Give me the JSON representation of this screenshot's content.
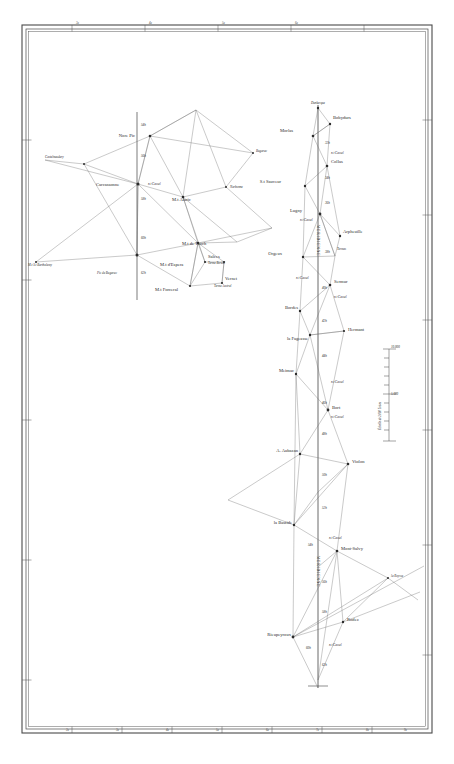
{
  "sheet": {
    "title": "Carte de la Meridienne de France — Triangulation",
    "background_color": "#ffffff",
    "ink_color": "#2b2b2b",
    "line_color": "#555555"
  },
  "frame": {
    "outer": {
      "x": 22,
      "y": 25,
      "w": 410,
      "h": 708
    },
    "inner_offset": 4,
    "top_ticks": [
      "3e",
      "4e",
      "5e",
      "6e"
    ],
    "bottom_ticks": [
      "2e",
      "3e",
      "4e",
      "5e",
      "6e",
      "7e",
      "8e",
      "9e"
    ],
    "left_ticks": [
      "44",
      "43",
      "42"
    ],
    "right_ticks": [
      "44",
      "43",
      "42",
      "41"
    ]
  },
  "scale_bar": {
    "caption": "Échelle de 2 000 Toises",
    "top_label": "10.000",
    "mid_label": "5.000",
    "ticks": [
      "10.000",
      "9",
      "8",
      "7",
      "6",
      "5.000",
      "4",
      "3",
      "2",
      "1",
      "0"
    ],
    "x": 389,
    "y_top": 349,
    "y_bottom": 441
  },
  "west_network": {
    "name": "Carcassonne – Mont Alaric group",
    "stations": [
      {
        "label": "Nore Pic",
        "x": 138,
        "y": 136,
        "anchor": "end",
        "dx": -3,
        "dy": 1
      },
      {
        "label": "Castelnaudary",
        "x": 45,
        "y": 158,
        "anchor": "start",
        "dx": 0,
        "dy": 0,
        "style": "small"
      },
      {
        "label": "Carcassonne",
        "x": 96,
        "y": 185,
        "anchor": "start",
        "dx": 0,
        "dy": 0
      },
      {
        "label": "M.t Alaric",
        "x": 170,
        "y": 199,
        "anchor": "start",
        "dx": 2,
        "dy": 2
      },
      {
        "label": "Narbonne",
        "x": 228,
        "y": 187,
        "anchor": "start",
        "dx": 2,
        "dy": 1,
        "style": "small"
      },
      {
        "label": "Bugarac",
        "x": 254,
        "y": 152,
        "anchor": "start",
        "dx": 0,
        "dy": 0,
        "style": "small"
      },
      {
        "label": "M.t de Tauch",
        "x": 180,
        "y": 243,
        "anchor": "start",
        "dx": 2,
        "dy": 2
      },
      {
        "label": "M.t d'Espera",
        "x": 160,
        "y": 264,
        "anchor": "start",
        "dx": 2,
        "dy": 2
      },
      {
        "label": "M.t Forceral",
        "x": 155,
        "y": 289,
        "anchor": "start",
        "dx": 2,
        "dy": 2
      },
      {
        "label": "Salces",
        "x": 206,
        "y": 257,
        "anchor": "start",
        "dx": 2,
        "dy": 0
      },
      {
        "label": "Terme Boréal",
        "x": 206,
        "y": 263,
        "anchor": "start",
        "dx": 2,
        "dy": 0,
        "style": "term"
      },
      {
        "label": "Vernet",
        "x": 221,
        "y": 279,
        "anchor": "start",
        "dx": 2,
        "dy": 0
      },
      {
        "label": "Terme Austral",
        "x": 212,
        "y": 286,
        "anchor": "start",
        "dx": 2,
        "dy": 0,
        "style": "term"
      },
      {
        "label": "M.t S.t Barthelemy",
        "x": 28,
        "y": 265,
        "anchor": "start",
        "dx": 0,
        "dy": 0,
        "style": "small"
      },
      {
        "label": "Pic de Bugarac",
        "x": 97,
        "y": 272,
        "anchor": "start",
        "dx": 0,
        "dy": 0,
        "style": "small"
      }
    ],
    "meridian_marks": [
      {
        "label": "54h",
        "x": 143,
        "y": 124
      },
      {
        "label": "56h",
        "x": 143,
        "y": 155
      },
      {
        "label": "n.t Cassel",
        "x": 148,
        "y": 184
      },
      {
        "label": "58h",
        "x": 143,
        "y": 198
      },
      {
        "label": "60h",
        "x": 143,
        "y": 237
      },
      {
        "label": "62h",
        "x": 143,
        "y": 272
      }
    ],
    "vertices": [
      {
        "id": "norepic",
        "x": 150,
        "y": 136
      },
      {
        "id": "carcassonne",
        "x": 138,
        "y": 184
      },
      {
        "id": "alaric",
        "x": 183,
        "y": 197
      },
      {
        "id": "tauch",
        "x": 198,
        "y": 243
      },
      {
        "id": "espera",
        "x": 205,
        "y": 262
      },
      {
        "id": "forceral",
        "x": 190,
        "y": 286
      },
      {
        "id": "salces",
        "x": 224,
        "y": 262
      },
      {
        "id": "vernet",
        "x": 222,
        "y": 283
      },
      {
        "id": "narbonne",
        "x": 226,
        "y": 187
      },
      {
        "id": "bugarac_n",
        "x": 253,
        "y": 153
      },
      {
        "id": "apex_ne",
        "x": 196,
        "y": 110
      },
      {
        "id": "right_far",
        "x": 272,
        "y": 228
      },
      {
        "id": "castel",
        "x": 84,
        "y": 164
      },
      {
        "id": "barthelemy",
        "x": 36,
        "y": 262
      },
      {
        "id": "pic_bug",
        "x": 137,
        "y": 255
      },
      {
        "id": "cassel_pt",
        "x": 137,
        "y": 184
      },
      {
        "id": "eastpt",
        "x": 237,
        "y": 242
      }
    ]
  },
  "east_network": {
    "name": "Méridienne chain (Dunkerque – Barcelone)",
    "top_label": "Dunkerque",
    "chain_label_upper": "MERIDIENNE",
    "chain_label_lower": "MERIDIENNE",
    "stations": [
      {
        "label": "Bobydurs",
        "x": 332,
        "y": 118,
        "anchor": "start",
        "dx": 0,
        "dy": 0
      },
      {
        "label": "Morlas",
        "x": 294,
        "y": 130,
        "anchor": "start",
        "dx": 0,
        "dy": 0
      },
      {
        "label": "Collas",
        "x": 330,
        "y": 159,
        "anchor": "start",
        "dx": 0,
        "dy": 0
      },
      {
        "label": "S.t Sauveur",
        "x": 281,
        "y": 180,
        "anchor": "start",
        "dx": 0,
        "dy": 0
      },
      {
        "label": "Lugny",
        "x": 303,
        "y": 210,
        "anchor": "start",
        "dx": 0,
        "dy": 0
      },
      {
        "label": "Arpheuille",
        "x": 342,
        "y": 230,
        "anchor": "start",
        "dx": 0,
        "dy": 0
      },
      {
        "label": "Orgeux",
        "x": 284,
        "y": 252,
        "anchor": "start",
        "dx": 0,
        "dy": 0
      },
      {
        "label": "Termes",
        "x": 336,
        "y": 250,
        "anchor": "start",
        "dx": 0,
        "dy": 0,
        "style": "small"
      },
      {
        "label": "Sermur",
        "x": 334,
        "y": 281,
        "anchor": "start",
        "dx": 0,
        "dy": 0
      },
      {
        "label": "Bordes",
        "x": 291,
        "y": 307,
        "anchor": "start",
        "dx": 0,
        "dy": 0
      },
      {
        "label": "Hermant",
        "x": 347,
        "y": 329,
        "anchor": "start",
        "dx": 0,
        "dy": 0
      },
      {
        "label": "la Fageasse",
        "x": 281,
        "y": 338,
        "anchor": "start",
        "dx": 0,
        "dy": 0
      },
      {
        "label": "Meimac",
        "x": 285,
        "y": 371,
        "anchor": "start",
        "dx": 0,
        "dy": 0
      },
      {
        "label": "Bort",
        "x": 333,
        "y": 408,
        "anchor": "start",
        "dx": 0,
        "dy": 0
      },
      {
        "label": "A. Aubazan",
        "x": 288,
        "y": 451,
        "anchor": "start",
        "dx": 0,
        "dy": 0
      },
      {
        "label": "Violon",
        "x": 351,
        "y": 462,
        "anchor": "start",
        "dx": 0,
        "dy": 0
      },
      {
        "label": "la Bastide",
        "x": 282,
        "y": 522,
        "anchor": "start",
        "dx": 0,
        "dy": 0
      },
      {
        "label": "Mont-Salvy",
        "x": 340,
        "y": 547,
        "anchor": "start",
        "dx": 0,
        "dy": 0
      },
      {
        "label": "la Roysse",
        "x": 390,
        "y": 577,
        "anchor": "start",
        "dx": 0,
        "dy": 0,
        "style": "small"
      },
      {
        "label": "Rodez",
        "x": 345,
        "y": 620,
        "anchor": "start",
        "dx": 0,
        "dy": 0
      },
      {
        "label": "Rieupeyroux",
        "x": 262,
        "y": 634,
        "anchor": "start",
        "dx": 0,
        "dy": 0
      }
    ],
    "meridian_marks": [
      {
        "label": "32h",
        "x": 325,
        "y": 143
      },
      {
        "label": "n.t Cassel",
        "x": 331,
        "y": 153
      },
      {
        "label": "34h",
        "x": 325,
        "y": 178
      },
      {
        "label": "36h",
        "x": 325,
        "y": 203
      },
      {
        "label": "n.t Cassel",
        "x": 316,
        "y": 220
      },
      {
        "label": "38h",
        "x": 325,
        "y": 252
      },
      {
        "label": "n.t Cassel",
        "x": 305,
        "y": 278
      },
      {
        "label": "40h",
        "x": 322,
        "y": 288
      },
      {
        "label": "n.t Cassel",
        "x": 334,
        "y": 297
      },
      {
        "label": "42h",
        "x": 322,
        "y": 321
      },
      {
        "label": "44h",
        "x": 322,
        "y": 356
      },
      {
        "label": "n.t Cassel",
        "x": 331,
        "y": 382
      },
      {
        "label": "46h",
        "x": 322,
        "y": 403
      },
      {
        "label": "n.t Cassel",
        "x": 331,
        "y": 417
      },
      {
        "label": "48h",
        "x": 322,
        "y": 434
      },
      {
        "label": "50h",
        "x": 322,
        "y": 475
      },
      {
        "label": "52h",
        "x": 322,
        "y": 508
      },
      {
        "label": "n.t Cassel",
        "x": 329,
        "y": 538
      },
      {
        "label": "54h",
        "x": 320,
        "y": 545
      },
      {
        "label": "56h",
        "x": 322,
        "y": 582
      },
      {
        "label": "58h",
        "x": 322,
        "y": 612
      },
      {
        "label": "n.t Cassel",
        "x": 329,
        "y": 645
      },
      {
        "label": "60h",
        "x": 320,
        "y": 648
      },
      {
        "label": "62h",
        "x": 320,
        "y": 665
      }
    ],
    "vertices": [
      {
        "id": "dunkerque",
        "x": 318,
        "y": 108
      },
      {
        "id": "bobydurs",
        "x": 330,
        "y": 124
      },
      {
        "id": "morlas",
        "x": 313,
        "y": 136
      },
      {
        "id": "collas",
        "x": 327,
        "y": 166
      },
      {
        "id": "stsauveur",
        "x": 305,
        "y": 186
      },
      {
        "id": "lugny",
        "x": 320,
        "y": 214
      },
      {
        "id": "arpheuille",
        "x": 340,
        "y": 236
      },
      {
        "id": "orgeux",
        "x": 303,
        "y": 257
      },
      {
        "id": "termes",
        "x": 335,
        "y": 256
      },
      {
        "id": "sermur",
        "x": 330,
        "y": 285
      },
      {
        "id": "bordes",
        "x": 300,
        "y": 311
      },
      {
        "id": "fageasse",
        "x": 310,
        "y": 335
      },
      {
        "id": "hermant",
        "x": 344,
        "y": 331
      },
      {
        "id": "meimac",
        "x": 296,
        "y": 374
      },
      {
        "id": "bort",
        "x": 328,
        "y": 410
      },
      {
        "id": "aubazan",
        "x": 300,
        "y": 454
      },
      {
        "id": "violon",
        "x": 348,
        "y": 464
      },
      {
        "id": "bastide",
        "x": 294,
        "y": 525
      },
      {
        "id": "montsalvy",
        "x": 337,
        "y": 551
      },
      {
        "id": "roysse",
        "x": 388,
        "y": 578
      },
      {
        "id": "rodez",
        "x": 343,
        "y": 622
      },
      {
        "id": "rieupeyroux",
        "x": 293,
        "y": 637
      },
      {
        "id": "mid1",
        "x": 318,
        "y": 492
      },
      {
        "id": "mid2",
        "x": 318,
        "y": 567
      },
      {
        "id": "far_sw",
        "x": 228,
        "y": 500
      },
      {
        "id": "bot_tail",
        "x": 318,
        "y": 680
      }
    ]
  }
}
